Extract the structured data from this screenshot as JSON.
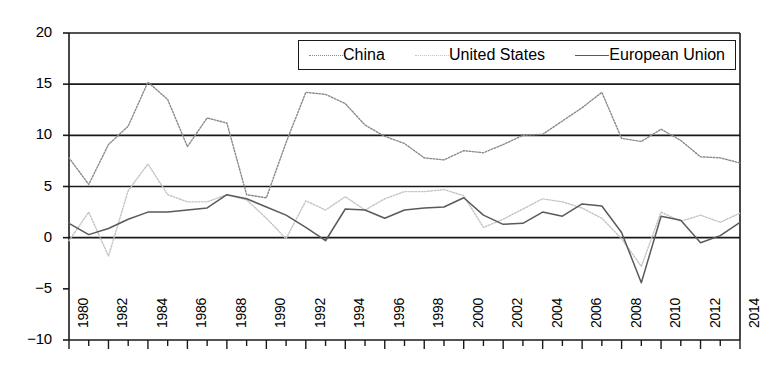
{
  "chart_data": {
    "type": "line",
    "title": "",
    "xlabel": "",
    "ylabel": "",
    "xlim": [
      1980,
      2014
    ],
    "ylim": [
      -10,
      20
    ],
    "yticks": [
      20,
      15,
      10,
      5,
      0,
      -5,
      -10
    ],
    "ytick_labels": [
      "20",
      "15",
      "10",
      "5",
      "0",
      "−5",
      "−10"
    ],
    "gridlines_y": [
      0,
      5,
      10,
      15,
      20
    ],
    "grid": true,
    "legend_position": "top-right",
    "x": [
      1980,
      1981,
      1982,
      1983,
      1984,
      1985,
      1986,
      1987,
      1988,
      1989,
      1990,
      1991,
      1992,
      1993,
      1994,
      1995,
      1996,
      1997,
      1998,
      1999,
      2000,
      2001,
      2002,
      2003,
      2004,
      2005,
      2006,
      2007,
      2008,
      2009,
      2010,
      2011,
      2012,
      2013,
      2014
    ],
    "xtick_values": [
      1980,
      1982,
      1984,
      1986,
      1988,
      1990,
      1992,
      1994,
      1996,
      1998,
      2000,
      2002,
      2004,
      2006,
      2008,
      2010,
      2012,
      2014
    ],
    "xtick_labels": [
      "1980",
      "1982",
      "1984",
      "1986",
      "1988",
      "1990",
      "1992",
      "1994",
      "1996",
      "1998",
      "2000",
      "2002",
      "2004",
      "2006",
      "2008",
      "2010",
      "2012",
      "2014"
    ],
    "series": [
      {
        "name": "China",
        "color": "#8a8a8a",
        "style": "dotted",
        "values": [
          7.8,
          5.2,
          9.1,
          10.9,
          15.2,
          13.5,
          8.9,
          11.7,
          11.2,
          4.2,
          3.9,
          9.3,
          14.2,
          14.0,
          13.1,
          11.0,
          9.9,
          9.2,
          7.8,
          7.6,
          8.5,
          8.3,
          9.1,
          10.0,
          10.1,
          11.4,
          12.7,
          14.2,
          9.7,
          9.4,
          10.6,
          9.5,
          7.9,
          7.8,
          7.3
        ]
      },
      {
        "name": "United States",
        "color": "#c4c4c4",
        "style": "dotted",
        "values": [
          -0.3,
          2.5,
          -1.8,
          4.6,
          7.2,
          4.2,
          3.5,
          3.5,
          4.2,
          3.7,
          1.9,
          -0.1,
          3.6,
          2.7,
          4.0,
          2.7,
          3.8,
          4.5,
          4.5,
          4.7,
          4.1,
          1.0,
          1.8,
          2.8,
          3.8,
          3.5,
          2.9,
          1.9,
          -0.1,
          -2.8,
          2.5,
          1.6,
          2.2,
          1.5,
          2.4
        ]
      },
      {
        "name": "European Union",
        "color": "#5a5a5a",
        "style": "solid",
        "values": [
          1.4,
          0.3,
          0.9,
          1.8,
          2.5,
          2.5,
          2.7,
          2.9,
          4.2,
          3.8,
          3.0,
          2.2,
          1.0,
          -0.3,
          2.8,
          2.7,
          1.9,
          2.7,
          2.9,
          3.0,
          3.9,
          2.2,
          1.3,
          1.4,
          2.5,
          2.1,
          3.3,
          3.1,
          0.5,
          -4.4,
          2.1,
          1.7,
          -0.5,
          0.2,
          1.5
        ]
      }
    ]
  },
  "legend": {
    "entries": [
      {
        "label": "China"
      },
      {
        "label": "United States"
      },
      {
        "label": "European Union"
      }
    ]
  },
  "colors": {
    "axis": "#1a1a1a",
    "gridline": "#1a1a1a",
    "background": "#ffffff"
  }
}
